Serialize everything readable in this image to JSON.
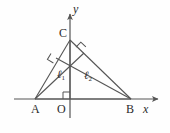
{
  "figure": {
    "background_color": "#fefefe",
    "stroke_color": "#555555",
    "text_color": "#2b2b2b",
    "width": 170,
    "height": 133
  },
  "axes": {
    "x_label": "x",
    "y_label": "y",
    "origin_label": "O",
    "x_axis": {
      "x1": 14,
      "y1": 99,
      "x2": 158,
      "y2": 99,
      "arrow": "right"
    },
    "y_axis": {
      "x1": 70,
      "y1": 118,
      "x2": 70,
      "y2": 14,
      "arrow": "up"
    }
  },
  "points": [
    {
      "name": "A",
      "label": "A",
      "x": 35,
      "y": 99,
      "label_x": 31,
      "label_y": 103
    },
    {
      "name": "B",
      "label": "B",
      "x": 131,
      "y": 99,
      "label_x": 127,
      "label_y": 103
    },
    {
      "name": "C",
      "label": "C",
      "x": 70,
      "y": 40,
      "label_x": 59,
      "label_y": 27
    },
    {
      "name": "O",
      "label": "O",
      "x": 70,
      "y": 99,
      "label_x": 57,
      "label_y": 103
    },
    {
      "name": "H",
      "label": "",
      "x": 70,
      "y": 62,
      "label_x": 0,
      "label_y": 0
    }
  ],
  "segments": [
    {
      "name": "side-AC",
      "x1": 35,
      "y1": 99,
      "x2": 70,
      "y2": 40
    },
    {
      "name": "side-CB",
      "x1": 70,
      "y1": 40,
      "x2": 131,
      "y2": 99
    },
    {
      "name": "side-AB",
      "x1": 35,
      "y1": 99,
      "x2": 131,
      "y2": 99
    },
    {
      "name": "altitude-from-B",
      "x1": 131,
      "y1": 99,
      "x2": 56,
      "y2": 58
    },
    {
      "name": "altitude-from-A",
      "x1": 35,
      "y1": 99,
      "x2": 84,
      "y2": 53
    },
    {
      "name": "altitude-from-C",
      "x1": 70,
      "y1": 40,
      "x2": 70,
      "y2": 99
    }
  ],
  "right_angle_marks": [
    {
      "name": "right-angle-on-AC",
      "cx": 57,
      "cy": 57,
      "size": 7,
      "rotation": -59
    },
    {
      "name": "right-angle-on-CB",
      "cx": 81,
      "cy": 52,
      "size": 7,
      "rotation": 44
    },
    {
      "name": "right-angle-at-origin",
      "cx": 70,
      "cy": 99,
      "size": 7,
      "rotation": 0
    }
  ],
  "line_labels": [
    {
      "name": "line-label-l1",
      "text": "ℓ",
      "sub": "1",
      "x": 57,
      "y": 69
    },
    {
      "name": "line-label-l2",
      "text": "ℓ",
      "sub": "2",
      "x": 84,
      "y": 70
    }
  ]
}
